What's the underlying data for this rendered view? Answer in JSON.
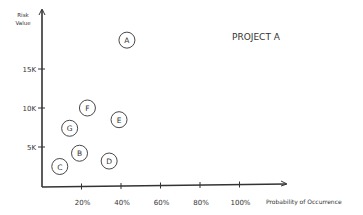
{
  "chart_data": {
    "type": "scatter",
    "title": "PROJECT A",
    "xlabel": "Probability of Occurrence",
    "ylabel": "Risk Value",
    "ylabel_lines": [
      "Risk",
      "Value"
    ],
    "x_ticks": [
      "20%",
      "40%",
      "60%",
      "80%",
      "100%"
    ],
    "x_tick_values": [
      20,
      40,
      60,
      80,
      100
    ],
    "y_ticks": [
      "5K",
      "10K",
      "15K"
    ],
    "y_tick_values": [
      5000,
      10000,
      15000
    ],
    "xlim": [
      0,
      100
    ],
    "ylim": [
      0,
      20000
    ],
    "grid": false,
    "points": [
      {
        "label": "A",
        "x": 43,
        "y": 18700
      },
      {
        "label": "B",
        "x": 19,
        "y": 4200
      },
      {
        "label": "C",
        "x": 9,
        "y": 2500
      },
      {
        "label": "D",
        "x": 34,
        "y": 3200
      },
      {
        "label": "E",
        "x": 39,
        "y": 8500
      },
      {
        "label": "F",
        "x": 23,
        "y": 10000
      },
      {
        "label": "G",
        "x": 14,
        "y": 7400
      }
    ]
  },
  "colors": {
    "ink": "#333333",
    "background": "#ffffff"
  }
}
